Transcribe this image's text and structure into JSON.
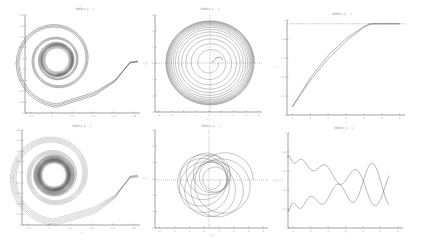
{
  "figure": {
    "background": "#ffffff",
    "line_color": "#555555",
    "axis_color": "#666666"
  },
  "chart_data": [
    {
      "id": "p1",
      "type": "line",
      "title": "SMD(x_1, ...)",
      "xlabel": "x",
      "ylabel": "y",
      "xticks": [
        "-0.2",
        "0",
        "0.2",
        "0.4",
        "0.6",
        "0.8"
      ],
      "yticks": [
        "0.8",
        "0.6",
        "0.4",
        "0.2",
        "0",
        "-0.2",
        "-0.4",
        "-0.6",
        "-0.8",
        "-1"
      ],
      "grid": false,
      "description": "Inward spiral trajectories converging to a limit cycle near origin, with a tail extending to the right"
    },
    {
      "id": "p2",
      "type": "line",
      "title": "SMD(x_1, ...)",
      "xlabel": "x_1",
      "ylabel": "x_2",
      "xticks": [
        "-4",
        "-3",
        "-2",
        "-1",
        "0",
        "1",
        "2",
        "3",
        "4"
      ],
      "yticks": [
        "3",
        "2",
        "1",
        "0",
        "-1",
        "-2",
        "-3"
      ],
      "grid": false,
      "dashed_origin_axes": true,
      "description": "Outward spiral phase portrait with many concentric loops"
    },
    {
      "id": "p3",
      "type": "line",
      "title": "SMD(x_1, ...)",
      "xlabel": "t",
      "ylabel": "x",
      "xticks": [
        "0",
        "1",
        "2",
        "3",
        "4",
        "5",
        "6"
      ],
      "yticks": [
        "1",
        "0.8",
        "0.6",
        "0.4",
        "0.2",
        "0"
      ],
      "reference_line": 1.0,
      "series": [
        {
          "name": "a",
          "x": [
            0,
            1,
            2,
            3,
            4,
            4.3,
            6
          ],
          "y": [
            0.05,
            0.35,
            0.6,
            0.8,
            0.96,
            1.0,
            1.0
          ]
        },
        {
          "name": "b",
          "x": [
            0,
            1,
            2,
            3,
            4,
            4.5,
            6
          ],
          "y": [
            0.05,
            0.38,
            0.64,
            0.83,
            0.97,
            1.0,
            1.0
          ]
        }
      ]
    },
    {
      "id": "p4",
      "type": "line",
      "title": "SMD(x_1, ...)",
      "xlabel": "x",
      "ylabel": "y",
      "xticks": [
        "-0.2",
        "0",
        "0.2",
        "0.4",
        "0.6",
        "0.8"
      ],
      "yticks": [
        "0.8",
        "0.6",
        "0.4",
        "0.2",
        "0",
        "-0.2",
        "-0.4",
        "-0.6",
        "-0.8",
        "-1"
      ],
      "description": "Dense inward spiral (marked) converging to limit cycle, tail to the right"
    },
    {
      "id": "p5",
      "type": "line",
      "title": "SMD(x_1, ...)",
      "xlabel": "x_1",
      "ylabel": "x_2",
      "xticks": [
        "-3",
        "-2",
        "-1",
        "0",
        "1",
        "2",
        "3",
        "4"
      ],
      "yticks": [
        "3",
        "2",
        "1",
        "0",
        "-1",
        "-2",
        "-3"
      ],
      "dashed_origin_axes": true,
      "description": "Offset circular loops forming a rosette phase portrait"
    },
    {
      "id": "p6",
      "type": "line",
      "title": "SMD(x_1, ...)",
      "xlabel": "t",
      "ylabel": "x_1, x_2",
      "xticks": [
        "0",
        "1",
        "2",
        "3",
        "4",
        "5",
        "6"
      ],
      "yticks": [
        "1",
        "0.8",
        "0.6",
        "0.4",
        "0.2",
        "0"
      ],
      "description": "Two oscillating signals with growing amplitude and decreasing frequency"
    }
  ]
}
